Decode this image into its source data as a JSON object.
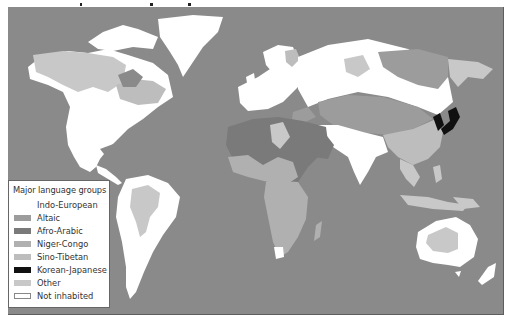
{
  "map": {
    "title_visible": "",
    "colors": {
      "ocean": "#8a8a8a",
      "indo_european": "#ffffff",
      "altaic": "#9c9c9c",
      "afro_arabic": "#7a7a7a",
      "niger_congo": "#b0b0b0",
      "sino_tibetan": "#bdbdbd",
      "korean_japanese": "#111111",
      "other": "#c8c8c8",
      "not_inhabited": "#ffffff"
    }
  },
  "legend": {
    "title": "Major language groups",
    "items": [
      {
        "label": "Indo-European",
        "color": "#ffffff",
        "border": "none"
      },
      {
        "label": "Altaic",
        "color": "#9c9c9c",
        "border": "none"
      },
      {
        "label": "Afro-Arabic",
        "color": "#7a7a7a",
        "border": "none"
      },
      {
        "label": "Niger-Congo",
        "color": "#b0b0b0",
        "border": "none"
      },
      {
        "label": "Sino-Tibetan",
        "color": "#bdbdbd",
        "border": "none"
      },
      {
        "label": "Korean-Japanese",
        "color": "#111111",
        "border": "none"
      },
      {
        "label": "Other",
        "color": "#c8c8c8",
        "border": "none"
      },
      {
        "label": "Not inhabited",
        "color": "#ffffff",
        "border": "1px solid #888"
      }
    ]
  }
}
